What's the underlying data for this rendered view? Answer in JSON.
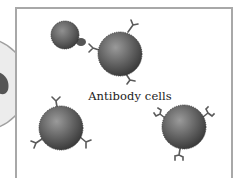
{
  "diagram": {
    "label": "Antibody cells",
    "colors": {
      "frame_border": "#a8a8a8",
      "outer_circle_fill": "#ececec",
      "outer_circle_border": "#a0a0a0",
      "cell_dark": "#3a3a3a",
      "cell_light": "#8a8a8a",
      "antibody": "#5a5a5a"
    },
    "elements": [
      {
        "type": "large-circle",
        "description": "Partially visible large light grey cell with dark inclusion"
      },
      {
        "type": "small-cell",
        "description": "Small cell with protruding antigen tab"
      },
      {
        "type": "antibody-cell",
        "antibodies": 3,
        "position": "top-center"
      },
      {
        "type": "antibody-cell",
        "antibodies": 3,
        "position": "bottom-left"
      },
      {
        "type": "antibody-cell",
        "antibodies": 3,
        "position": "bottom-right"
      }
    ]
  }
}
